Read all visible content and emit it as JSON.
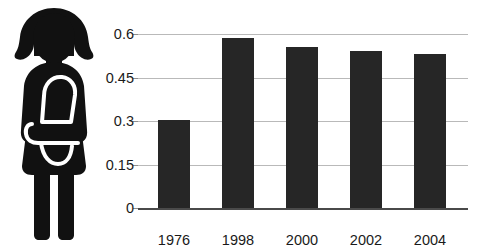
{
  "pictogram": {
    "icon_name": "woman-carrying-baby-pictogram",
    "description": "Silhouette of a woman holding a baby in a front carrier",
    "color": "#111111"
  },
  "chart_data": {
    "type": "bar",
    "title": "",
    "subtitle": "",
    "xlabel": "",
    "ylabel": "",
    "categories": [
      "1976",
      "1998",
      "2000",
      "2002",
      "2004"
    ],
    "values": [
      0.305,
      0.585,
      0.555,
      0.54,
      0.53
    ],
    "ylim": [
      0,
      0.6
    ],
    "yticks": [
      0,
      0.15,
      0.3,
      0.45,
      0.6
    ],
    "ytick_labels": [
      "0",
      "0.15",
      "0.3",
      "0.45",
      "0.6"
    ],
    "grid": true,
    "legend": "none",
    "bar_color": "#262626",
    "gridline_color": "#b9b9b9",
    "axis_color": "#4a4a4a",
    "annotations": []
  }
}
